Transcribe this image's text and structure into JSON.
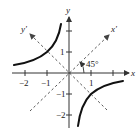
{
  "figure": {
    "axes": {
      "x_label": "x",
      "y_label": "y",
      "x_prime_label": "x'",
      "y_prime_label": "y'",
      "x_ticks": [
        {
          "value": -2,
          "label": "−2"
        },
        {
          "value": -1,
          "label": "−1"
        },
        {
          "value": 1,
          "label": "1"
        },
        {
          "value": 2,
          "label": ""
        }
      ],
      "y_ticks": [
        {
          "value": 2,
          "label": ""
        },
        {
          "value": 1,
          "label": "1"
        },
        {
          "value": -1,
          "label": "−1"
        },
        {
          "value": -2,
          "label": "−2"
        }
      ],
      "rotation_label": "45°"
    },
    "curve": {
      "equation": "xy = -1",
      "branches": [
        "upper-left",
        "lower-right"
      ]
    },
    "colors": {
      "curve": "#111111",
      "axis": "#333333",
      "dashed_axis": "#444444",
      "background": "#ffffff"
    }
  }
}
